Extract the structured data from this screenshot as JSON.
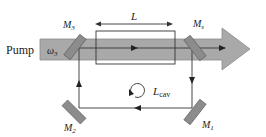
{
  "diagram": {
    "pump_label": "Pump",
    "pump_frequency": {
      "base": "ω",
      "sub": "3"
    },
    "crystal_length": {
      "base": "L"
    },
    "cavity_length": {
      "base": "L",
      "sub": "cav"
    },
    "mirrors": [
      {
        "id": "M3",
        "base": "M",
        "sub": "3"
      },
      {
        "id": "Ms",
        "base": "M",
        "sub": "s"
      },
      {
        "id": "M2",
        "base": "M",
        "sub": "2"
      },
      {
        "id": "M1",
        "base": "M",
        "sub": "1"
      }
    ],
    "colors": {
      "pump_beam": "#a9a9a9",
      "pump_edge": "#7a7a7a",
      "mirror": "#8c8c8c",
      "lines": "#333333"
    }
  }
}
